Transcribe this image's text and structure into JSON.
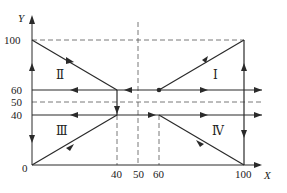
{
  "diagram": {
    "type": "phase-plane",
    "axes": {
      "x_label": "X",
      "y_label": "Y",
      "origin_label": "0",
      "x_ticks": [
        "40",
        "50",
        "60",
        "100"
      ],
      "y_ticks": [
        "100",
        "60",
        "50",
        "40"
      ]
    },
    "regions": [
      {
        "id": "I",
        "label": "Ⅰ"
      },
      {
        "id": "II",
        "label": "Ⅱ"
      },
      {
        "id": "III",
        "label": "Ⅲ"
      },
      {
        "id": "IV",
        "label": "Ⅳ"
      }
    ],
    "colors": {
      "line": "#2a2a2a",
      "dashed": "#555555",
      "background": "#ffffff"
    }
  }
}
